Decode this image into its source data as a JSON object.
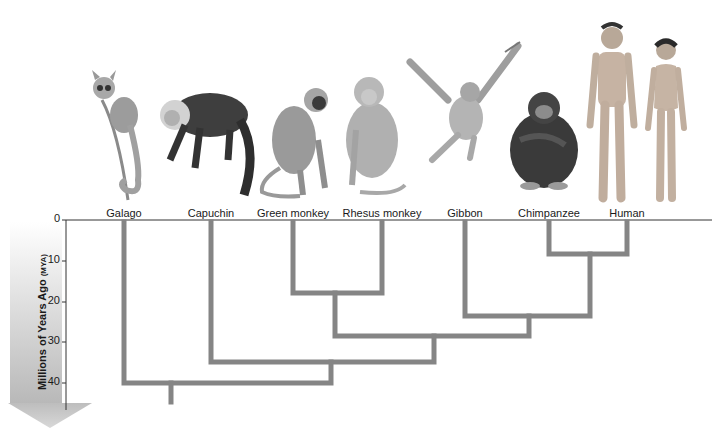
{
  "diagram": {
    "type": "phylogenetic-tree",
    "axis": {
      "title": "Millions of Years Ago",
      "unit": "(MYA)",
      "ticks": [
        "0",
        "10",
        "20",
        "30",
        "40"
      ],
      "tick_values": [
        0,
        10,
        20,
        30,
        40
      ],
      "direction": "down"
    },
    "taxa": [
      {
        "label": "Galago",
        "x": 124
      },
      {
        "label": "Capuchin",
        "x": 211
      },
      {
        "label": "Green monkey",
        "x": 293
      },
      {
        "label": "Rhesus monkey",
        "x": 382
      },
      {
        "label": "Gibbon",
        "x": 465
      },
      {
        "label": "Chimpanzee",
        "x": 549
      },
      {
        "label": "Human",
        "x": 627
      }
    ],
    "divergences": [
      {
        "clade": [
          "Chimpanzee",
          "Human"
        ],
        "mya": 8
      },
      {
        "clade": [
          "Green monkey",
          "Rhesus monkey"
        ],
        "mya": 18
      },
      {
        "clade": [
          "Gibbon",
          "Chimpanzee",
          "Human"
        ],
        "mya": 23
      },
      {
        "clade": [
          "Green monkey",
          "Rhesus monkey",
          "Gibbon",
          "Chimpanzee",
          "Human"
        ],
        "mya": 28
      },
      {
        "clade": [
          "Capuchin",
          "Green monkey",
          "Rhesus monkey",
          "Gibbon",
          "Chimpanzee",
          "Human"
        ],
        "mya": 35
      },
      {
        "clade": [
          "Galago",
          "Capuchin",
          "Green monkey",
          "Rhesus monkey",
          "Gibbon",
          "Chimpanzee",
          "Human"
        ],
        "mya": 40
      }
    ],
    "colors": {
      "branch": "#858585",
      "axis": "#333333",
      "arrow_top": "#ffffff",
      "arrow_bottom": "#bdbdbd"
    }
  }
}
